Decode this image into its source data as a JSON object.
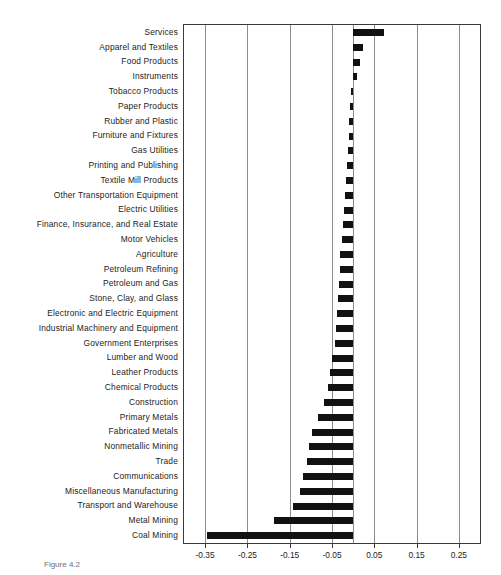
{
  "caption": "Figure 4.2",
  "chart_data": {
    "type": "bar",
    "orientation": "horizontal",
    "title": "",
    "xlabel": "",
    "ylabel": "",
    "xlim": [
      -0.4,
      0.3
    ],
    "xticks": [
      -0.35,
      -0.25,
      -0.15,
      -0.05,
      0.05,
      0.15,
      0.25
    ],
    "xticklabels": [
      "-0.35",
      "-0.25",
      "-0.15",
      "-0.05",
      "0.05",
      "0.15",
      "0.25"
    ],
    "grid": true,
    "grid_axis": "x",
    "legend": "none",
    "zero_reference_line": 0,
    "bar_color": "#111111",
    "categories": [
      "Services",
      "Apparel and Textiles",
      "Food Products",
      "Instruments",
      "Tobacco Products",
      "Paper Products",
      "Rubber and Plastic",
      "Furniture and Fixtures",
      "Gas Utilities",
      "Printing and Publishing",
      "Textile Mill Products",
      "Other Transportation Equipment",
      "Electric Utilities",
      "Finance, Insurance, and Real Estate",
      "Motor Vehicles",
      "Agriculture",
      "Petroleum Refining",
      "Petroleum and Gas",
      "Stone, Clay, and Glass",
      "Electronic and Electric Equipment",
      "Industrial Machinery and Equipment",
      "Government Enterprises",
      "Lumber and Wood",
      "Leather Products",
      "Chemical Products",
      "Construction",
      "Primary Metals",
      "Fabricated Metals",
      "Nonmetallic Mining",
      "Trade",
      "Communications",
      "Miscellaneous Manufacturing",
      "Transport and Warehouse",
      "Metal Mining",
      "Coal Mining"
    ],
    "values": [
      0.073,
      0.024,
      0.017,
      0.008,
      -0.004,
      -0.007,
      -0.009,
      -0.01,
      -0.012,
      -0.014,
      -0.017,
      -0.019,
      -0.022,
      -0.025,
      -0.027,
      -0.03,
      -0.032,
      -0.034,
      -0.036,
      -0.038,
      -0.041,
      -0.044,
      -0.05,
      -0.055,
      -0.06,
      -0.07,
      -0.082,
      -0.097,
      -0.104,
      -0.11,
      -0.118,
      -0.126,
      -0.143,
      -0.188,
      -0.345
    ]
  }
}
